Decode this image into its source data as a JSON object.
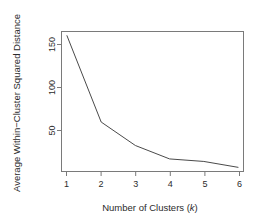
{
  "chart_data": {
    "type": "line",
    "title": "",
    "xlabel": "Number of Clusters (k)",
    "ylabel": "Average Within−Cluster Squared Distance",
    "x": [
      1,
      2,
      3,
      4,
      5,
      6
    ],
    "values": [
      167,
      64,
      36,
      20,
      17,
      10
    ],
    "series": [
      {
        "name": "Average Within-Cluster Squared Distance",
        "values": [
          167,
          64,
          36,
          20,
          17,
          10
        ]
      }
    ],
    "xlim": [
      0.84,
      6.16
    ],
    "ylim": [
      5,
      172
    ],
    "xticks": [
      1,
      2,
      3,
      4,
      5,
      6
    ],
    "xtick_labels": [
      "1",
      "2",
      "3",
      "4",
      "5",
      "6"
    ],
    "yticks": [
      50,
      100,
      150
    ],
    "ytick_labels": [
      "50",
      "100",
      "150"
    ],
    "grid": false,
    "legend": null,
    "line_color": "#4a4a4a",
    "axis_color": "#7a7a7a",
    "background": "#ffffff"
  },
  "axes": {
    "x_title_text": "Number of Clusters (",
    "x_title_italic": "k",
    "x_title_tail": ")",
    "y_title": "Average Within−Cluster Squared Distance"
  },
  "ticks": {
    "x": [
      {
        "label": "1"
      },
      {
        "label": "2"
      },
      {
        "label": "3"
      },
      {
        "label": "4"
      },
      {
        "label": "5"
      },
      {
        "label": "6"
      }
    ],
    "y": [
      {
        "label": "50"
      },
      {
        "label": "100"
      },
      {
        "label": "150"
      }
    ]
  }
}
